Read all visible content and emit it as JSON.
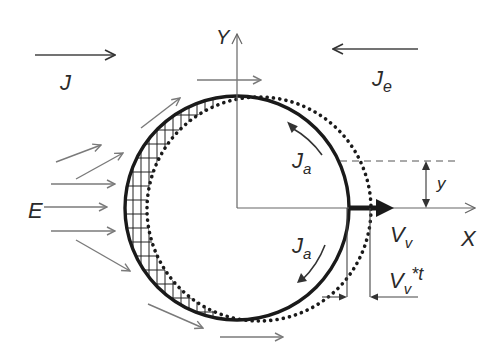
{
  "diagram": {
    "type": "physics-schematic",
    "labels": {
      "J": "J",
      "Je_main": "J",
      "Je_sub": "e",
      "E": "E",
      "Y_axis": "Y",
      "X_axis": "X",
      "Ja_top_main": "J",
      "Ja_top_sub": "a",
      "Ja_bottom_main": "J",
      "Ja_bottom_sub": "a",
      "Vv_main": "V",
      "Vv_sub": "v",
      "Vvt_main": "V",
      "Vvt_sub": "v",
      "Vvt_suffix": "*t",
      "y_dim": "y"
    },
    "colors": {
      "ink": "#1a1a1a",
      "light_arrow": "#7a7a7a",
      "axis": "#666666",
      "text": "#2a2a2a"
    },
    "geometry": {
      "solid_circle": {
        "cx": 237,
        "cy": 208,
        "r": 112
      },
      "dotted_circle": {
        "cx": 259,
        "cy": 209,
        "r": 112
      },
      "origin": {
        "x": 237,
        "y": 208
      }
    }
  }
}
